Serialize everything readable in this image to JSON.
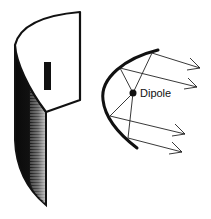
{
  "figure": {
    "left_illustration": "parabolic-cylinder-reflector-3d",
    "right_illustration": "parabolic-reflector-cross-section",
    "labels": {
      "dipole": "Dipole"
    },
    "colors": {
      "ink": "#111111",
      "background": "#ffffff"
    }
  }
}
